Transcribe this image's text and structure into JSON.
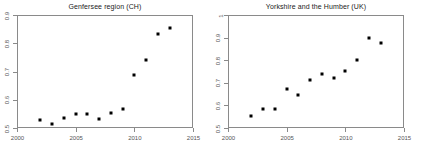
{
  "figure": {
    "width": 421,
    "height": 148,
    "background": "#ffffff",
    "point_color": "#000000",
    "axis_color": "#8a8a8a",
    "label_color": "#555555",
    "title_color": "#1a1a1a"
  },
  "chart_data": [
    {
      "type": "scatter",
      "title": "Genfersee region (CH)",
      "xlabel": "",
      "ylabel": "",
      "xlim": [
        2000,
        2015
      ],
      "ylim": [
        0.5,
        0.9
      ],
      "xticks": [
        2000,
        2005,
        2010,
        2015
      ],
      "xtick_labels": [
        "2000",
        "2005",
        "2010",
        "2015"
      ],
      "yticks": [
        0.5,
        0.6,
        0.7,
        0.8,
        0.9
      ],
      "ytick_labels": [
        "0.5",
        "0.6",
        "0.7",
        "0.8",
        "0.9"
      ],
      "grid": false,
      "legend": null,
      "x": [
        2002,
        2003,
        2004,
        2005,
        2006,
        2007,
        2008,
        2009,
        2010,
        2011,
        2012,
        2013
      ],
      "y": [
        0.527,
        0.515,
        0.537,
        0.549,
        0.548,
        0.531,
        0.553,
        0.566,
        0.688,
        0.739,
        0.831,
        0.855
      ]
    },
    {
      "type": "scatter",
      "title": "Yorkshire and the Humber (UK)",
      "xlabel": "",
      "ylabel": "",
      "xlim": [
        2000,
        2015
      ],
      "ylim": [
        0.5,
        1.0
      ],
      "xticks": [
        2000,
        2005,
        2010,
        2015
      ],
      "xtick_labels": [
        "2000",
        "2005",
        "2010",
        "2015"
      ],
      "yticks": [
        0.5,
        0.6,
        0.7,
        0.8,
        0.9,
        1.0
      ],
      "ytick_labels": [
        "0.5",
        "0.6",
        "0.7",
        "0.8",
        "0.9",
        "1"
      ],
      "grid": false,
      "legend": null,
      "x": [
        2002,
        2003,
        2004,
        2005,
        2006,
        2007,
        2008,
        2009,
        2010,
        2011,
        2012,
        2013
      ],
      "y": [
        0.552,
        0.583,
        0.584,
        0.673,
        0.645,
        0.712,
        0.74,
        0.722,
        0.752,
        0.799,
        0.898,
        0.877
      ]
    }
  ]
}
